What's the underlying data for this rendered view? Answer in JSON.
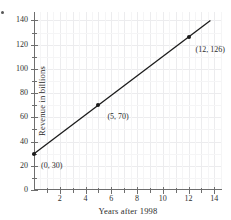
{
  "figure": {
    "problem_marker": "•"
  },
  "chart_data": {
    "type": "line",
    "title": "",
    "xlabel": "Years after 1998",
    "ylabel": "Revenue in billions",
    "xlim": [
      0,
      14.6
    ],
    "ylim": [
      0,
      147
    ],
    "grid": true,
    "legend": "none",
    "x_major_ticks": [
      2,
      4,
      6,
      8,
      10,
      12,
      14
    ],
    "x_major_tick_labels": [
      "2",
      "4",
      "6",
      "8",
      "10",
      "12",
      "14"
    ],
    "x_minor_ticks": [
      1,
      3,
      5,
      7,
      9,
      11,
      13
    ],
    "y_major_ticks": [
      0,
      20,
      40,
      60,
      80,
      100,
      120,
      140
    ],
    "y_major_tick_labels": [
      "0",
      "20",
      "40",
      "60",
      "80",
      "100",
      "120",
      "140"
    ],
    "series": [
      {
        "name": "Revenue",
        "type": "line",
        "color": "#1b1b1b",
        "line_from": [
          0,
          30
        ],
        "line_to": [
          13.7,
          140
        ],
        "points": [
          {
            "x": 0,
            "y": 30,
            "label": "(0, 30)",
            "label_dx": 7,
            "label_dy": 8
          },
          {
            "x": 5,
            "y": 70,
            "label": "(5, 70)",
            "label_dx": 9,
            "label_dy": 8
          },
          {
            "x": 12,
            "y": 126,
            "label": "(12, 126)",
            "label_dx": 7,
            "label_dy": 9
          }
        ]
      }
    ]
  }
}
